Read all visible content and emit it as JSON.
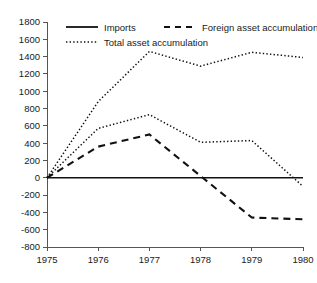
{
  "chart_data": {
    "type": "line",
    "title": "",
    "xlabel": "",
    "ylabel": "",
    "x": [
      1975,
      1976,
      1977,
      1978,
      1979,
      1980
    ],
    "xtick_labels": [
      "1975",
      "1976",
      "1977",
      "1978",
      "1979",
      "1980"
    ],
    "xlim": [
      1975,
      1980
    ],
    "ylim": [
      -800,
      1800
    ],
    "ytick_labels": [
      "1800",
      "1600",
      "1400",
      "1200",
      "1000",
      "800",
      "600",
      "400",
      "200",
      "0",
      "-200",
      "-400",
      "-600",
      "-800"
    ],
    "ytick_values": [
      1800,
      1600,
      1400,
      1200,
      1000,
      800,
      600,
      400,
      200,
      0,
      -200,
      -400,
      -600,
      -800
    ],
    "grid": false,
    "legend_position": "top-inside",
    "series": [
      {
        "name": "Imports",
        "style": "solid",
        "values": [
          0,
          0,
          0,
          0,
          0,
          0
        ]
      },
      {
        "name": "Foreign asset accumulation",
        "style": "dashed",
        "values": [
          0,
          360,
          500,
          20,
          -460,
          -480
        ]
      },
      {
        "name": "Total asset accumulation",
        "style": "dotted",
        "values": [
          0,
          880,
          1460,
          1290,
          1450,
          1390
        ]
      },
      {
        "name": "",
        "style": "dotted",
        "values": [
          0,
          570,
          730,
          410,
          430,
          -100
        ]
      }
    ],
    "legend": [
      {
        "label": "Imports",
        "style": "solid"
      },
      {
        "label": "Foreign asset accumulation",
        "style": "dashed"
      },
      {
        "label": "Total asset accumulation",
        "style": "dotted"
      }
    ]
  }
}
